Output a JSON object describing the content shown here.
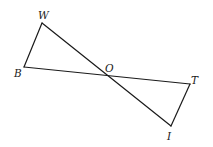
{
  "diagram": {
    "type": "geometry",
    "points": {
      "W": {
        "x": 42,
        "y": 23
      },
      "B": {
        "x": 24,
        "y": 67
      },
      "O": {
        "x": 107,
        "y": 75
      },
      "T": {
        "x": 190,
        "y": 84
      },
      "I": {
        "x": 171,
        "y": 126
      }
    },
    "segments": [
      {
        "from": "W",
        "to": "B"
      },
      {
        "from": "W",
        "to": "I"
      },
      {
        "from": "B",
        "to": "T"
      },
      {
        "from": "T",
        "to": "I"
      }
    ],
    "labels": [
      {
        "text": "W",
        "x": 38,
        "y": 19
      },
      {
        "text": "B",
        "x": 14,
        "y": 77
      },
      {
        "text": "O",
        "x": 105,
        "y": 72
      },
      {
        "text": "T",
        "x": 191,
        "y": 84
      },
      {
        "text": "I",
        "x": 167,
        "y": 140
      }
    ],
    "stroke_color": "#1a1a1a",
    "background_color": "#ffffff"
  }
}
